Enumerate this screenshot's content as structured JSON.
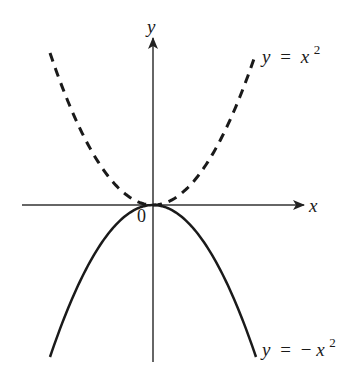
{
  "diagram": {
    "axes": {
      "x_label": "x",
      "y_label": "y",
      "origin_label": "0",
      "color": "#333333"
    },
    "curves": [
      {
        "name": "upper-parabola",
        "style": "dashed",
        "label_lhs": "y",
        "label_eq": "=",
        "label_rhs_base": "x",
        "label_rhs_sign": "",
        "label_exp": "2",
        "color": "#1a1a1a"
      },
      {
        "name": "lower-parabola",
        "style": "solid",
        "label_lhs": "y",
        "label_eq": "=",
        "label_rhs_base": "x",
        "label_rhs_sign": "−",
        "label_exp": "2",
        "color": "#1a1a1a"
      }
    ]
  }
}
